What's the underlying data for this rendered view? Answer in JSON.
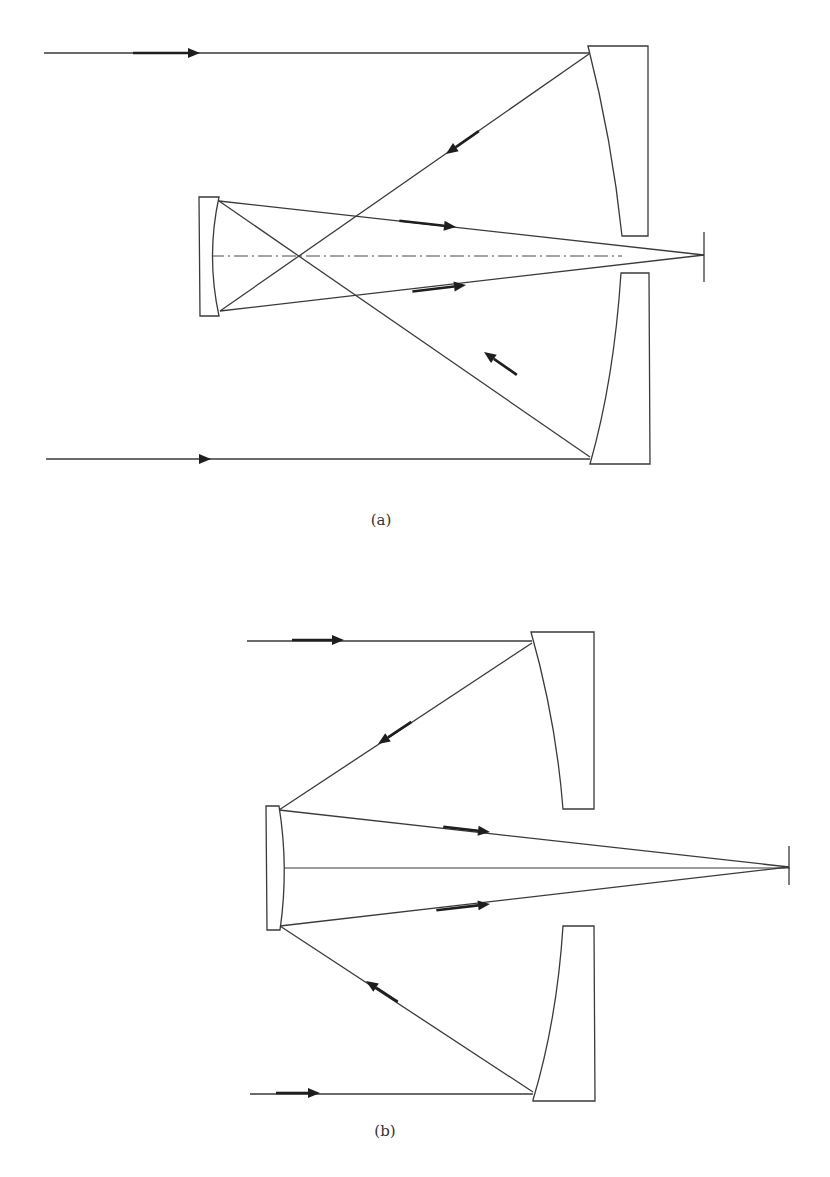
{
  "figure": {
    "colors": {
      "stroke": "#3a3a3a",
      "arrow": "#1e1e1e",
      "background": "#ffffff",
      "caption": "#333333"
    },
    "panels": [
      {
        "id": "a",
        "label": "(a)",
        "label_pos": [
          381,
          522
        ],
        "optical_axis": {
          "style": "dash-dot",
          "from": [
            210,
            256
          ],
          "to": [
            622,
            256
          ]
        },
        "focal_plane": {
          "x": 704,
          "y1": 232,
          "y2": 282
        },
        "focus": [
          704,
          255
        ],
        "primary_mirrors": [
          {
            "position": "upper",
            "outer": [
              [
                588,
                46
              ],
              [
                648,
                46
              ],
              [
                648,
                236
              ],
              [
                622,
                236
              ]
            ],
            "curve": [
              [
                588,
                46
              ],
              [
                612,
                140
              ],
              [
                622,
                236
              ]
            ]
          },
          {
            "position": "lower",
            "outer": [
              [
                621,
                273
              ],
              [
                649,
                273
              ],
              [
                650,
                464
              ],
              [
                590,
                464
              ]
            ],
            "curve": [
              [
                621,
                273
              ],
              [
                614,
                380
              ],
              [
                590,
                464
              ]
            ]
          }
        ],
        "secondary_mirror": {
          "rect": [
            [
              199,
              197
            ],
            [
              219,
              197
            ],
            [
              219,
              316
            ],
            [
              200,
              316
            ]
          ],
          "curve": [
            [
              219,
              197
            ],
            [
              206,
              256
            ],
            [
              220,
              311
            ]
          ]
        },
        "rays": [
          {
            "from": [
              44,
              53
            ],
            "to": [
              589,
              53
            ]
          },
          {
            "from": [
              589,
              54
            ],
            "to": [
              220,
              311
            ]
          },
          {
            "from": [
              46,
              459
            ],
            "to": [
              590,
              459
            ]
          },
          {
            "from": [
              590,
              457
            ],
            "to": [
              219,
              201
            ]
          },
          {
            "from": [
              219,
              201
            ],
            "to": [
              704,
              255
            ]
          },
          {
            "from": [
              220,
              311
            ],
            "to": [
              704,
              255
            ]
          }
        ],
        "arrows": [
          {
            "at": [
              200,
              53
            ],
            "dir": [
              1,
              0
            ],
            "tail": 55
          },
          {
            "at": [
              211,
              459
            ],
            "dir": [
              1,
              0
            ],
            "tail": 0
          },
          {
            "at": [
              446,
              154
            ],
            "dir": [
              -0.82,
              0.57
            ],
            "tail": 28
          },
          {
            "at": [
              484,
              352
            ],
            "dir": [
              -0.82,
              -0.57
            ],
            "tail": 28
          },
          {
            "at": [
              456,
              227
            ],
            "dir": [
              0.994,
              0.11
            ],
            "tail": 45
          },
          {
            "at": [
              466,
              285
            ],
            "dir": [
              0.992,
              -0.12
            ],
            "tail": 42
          }
        ]
      },
      {
        "id": "b",
        "label": "(b)",
        "label_pos": [
          385,
          1133
        ],
        "optical_axis": {
          "style": "solid",
          "from": [
            281,
            868
          ],
          "to": [
            790,
            868
          ]
        },
        "focal_plane": {
          "x": 789,
          "y1": 846,
          "y2": 885
        },
        "focus": [
          789,
          867
        ],
        "primary_mirrors": [
          {
            "position": "upper",
            "outer": [
              [
                531,
                632
              ],
              [
                594,
                632
              ],
              [
                594,
                809
              ],
              [
                563,
                809
              ]
            ],
            "curve": [
              [
                531,
                632
              ],
              [
                556,
                720
              ],
              [
                563,
                809
              ]
            ]
          },
          {
            "position": "lower",
            "outer": [
              [
                563,
                926
              ],
              [
                594,
                926
              ],
              [
                595,
                1101
              ],
              [
                533,
                1101
              ]
            ],
            "curve": [
              [
                563,
                926
              ],
              [
                557,
                1020
              ],
              [
                533,
                1100
              ]
            ]
          }
        ],
        "secondary_mirror": {
          "rect": [
            [
              266,
              806
            ],
            [
              279,
              806
            ],
            [
              280,
              930
            ],
            [
              267,
              930
            ]
          ],
          "curve": [
            [
              279,
              806
            ],
            [
              289,
              868
            ],
            [
              280,
              927
            ]
          ]
        },
        "rays": [
          {
            "from": [
              247,
              641
            ],
            "to": [
              532,
              641
            ]
          },
          {
            "from": [
              532,
              643
            ],
            "to": [
              279,
              810
            ]
          },
          {
            "from": [
              250,
              1094
            ],
            "to": [
              533,
              1094
            ]
          },
          {
            "from": [
              533,
              1092
            ],
            "to": [
              280,
              926
            ]
          },
          {
            "from": [
              279,
              810
            ],
            "to": [
              789,
              867
            ]
          },
          {
            "from": [
              280,
              926
            ],
            "to": [
              789,
              867
            ]
          }
        ],
        "arrows": [
          {
            "at": [
              344,
              640
            ],
            "dir": [
              1,
              0
            ],
            "tail": 40
          },
          {
            "at": [
              320,
              1093
            ],
            "dir": [
              1,
              0
            ],
            "tail": 32
          },
          {
            "at": [
              378,
              744
            ],
            "dir": [
              -0.83,
              0.55
            ],
            "tail": 28
          },
          {
            "at": [
              366,
              981
            ],
            "dir": [
              -0.84,
              -0.55
            ],
            "tail": 26
          },
          {
            "at": [
              490,
              832
            ],
            "dir": [
              0.994,
              0.11
            ],
            "tail": 35
          },
          {
            "at": [
              490,
              904
            ],
            "dir": [
              0.993,
              -0.116
            ],
            "tail": 42
          }
        ]
      }
    ]
  }
}
